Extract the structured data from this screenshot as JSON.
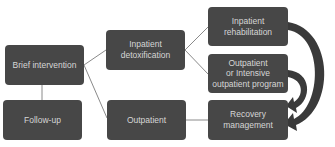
{
  "diagram": {
    "nodes": {
      "brief_intervention": {
        "lines": [
          "Brief intervention"
        ]
      },
      "follow_up": {
        "lines": [
          "Follow-up"
        ]
      },
      "inpatient_detox": {
        "lines": [
          "Inpatient",
          "detoxification"
        ]
      },
      "outpatient": {
        "lines": [
          "Outpatient"
        ]
      },
      "inpatient_rehab": {
        "lines": [
          "Inpatient",
          "rehabilitation"
        ]
      },
      "outpatient_iop": {
        "lines": [
          "Outpatient",
          "or Intensive",
          "outpatient program"
        ]
      },
      "recovery_management": {
        "lines": [
          "Recovery",
          "management"
        ]
      }
    },
    "edges": [
      {
        "from": "brief_intervention",
        "to": "follow_up",
        "style": "line"
      },
      {
        "from": "brief_intervention",
        "to": "inpatient_detox",
        "style": "line"
      },
      {
        "from": "brief_intervention",
        "to": "outpatient",
        "style": "line"
      },
      {
        "from": "inpatient_detox",
        "to": "inpatient_rehab",
        "style": "line"
      },
      {
        "from": "inpatient_detox",
        "to": "outpatient_iop",
        "style": "line"
      },
      {
        "from": "outpatient",
        "to": "recovery_management",
        "style": "line"
      },
      {
        "from": "inpatient_rehab",
        "to": "recovery_management",
        "style": "curved-arrow"
      },
      {
        "from": "outpatient_iop",
        "to": "recovery_management",
        "style": "curved-arrow"
      }
    ],
    "colors": {
      "box": "#474747",
      "text": "#d6d6d6",
      "line": "#8a8a8a",
      "arrow": "#3a3a3a"
    }
  }
}
